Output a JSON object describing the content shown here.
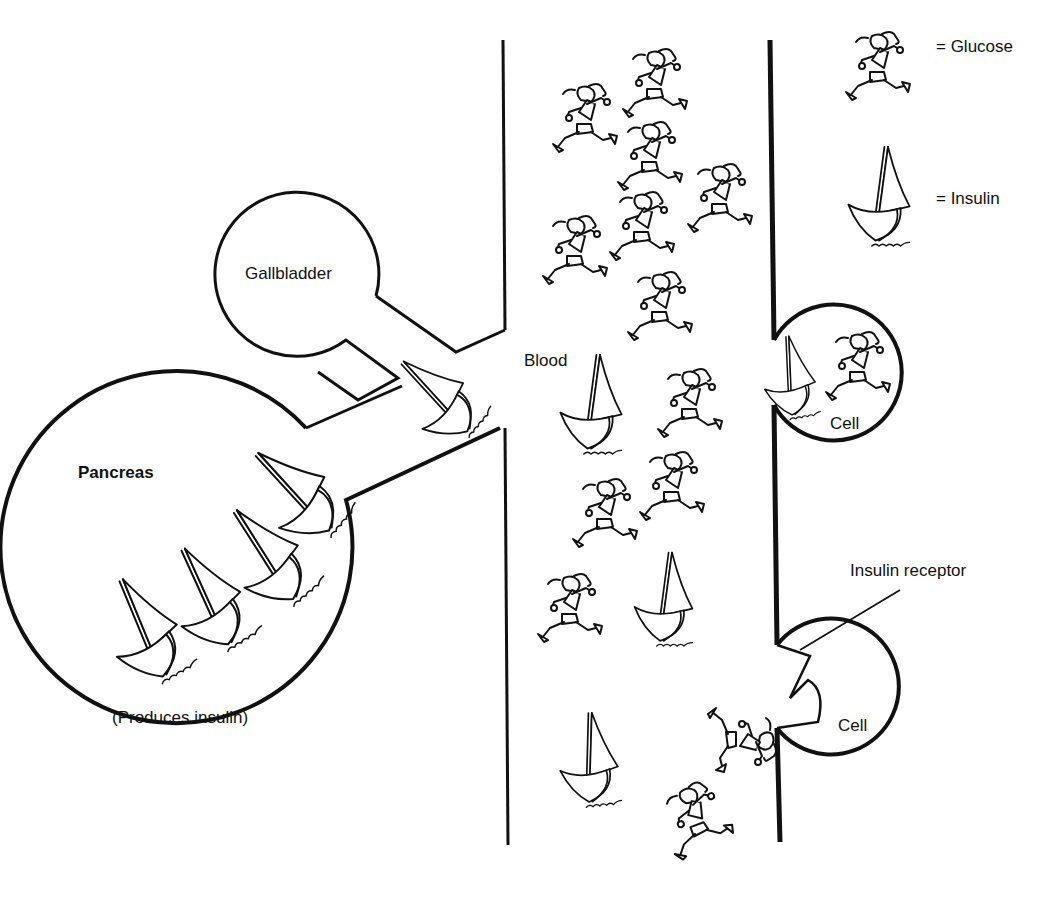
{
  "diagram": {
    "type": "illustration",
    "colors": {
      "ink": "#111111",
      "background": "#ffffff"
    }
  },
  "legend": {
    "glucose": {
      "symbol": "running-person",
      "label": "= Glucose"
    },
    "insulin": {
      "symbol": "sailboat",
      "label": "= Insulin"
    }
  },
  "organs": {
    "gallbladder": {
      "label": "Gallbladder"
    },
    "pancreas": {
      "label": "Pancreas",
      "caption": "(Produces insulin)"
    }
  },
  "vessel": {
    "label": "Blood"
  },
  "cells": [
    {
      "label": "Cell",
      "state": "insulin and glucose entering"
    },
    {
      "label": "Cell",
      "state": "receptor open",
      "receptor_label": "Insulin receptor"
    }
  ]
}
